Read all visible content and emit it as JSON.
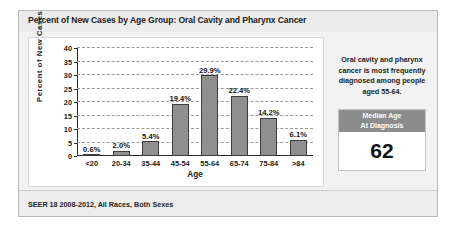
{
  "card": {
    "title": "Percent of New Cases by Age Group: Oral Cavity and Pharynx Cancer",
    "footer": "SEER 18 2008-2012, All Races, Both Sexes"
  },
  "side_panel": {
    "note": "Oral cavity and pharynx cancer is most frequently diagnosed among people aged 55-64.",
    "median_label_line1": "Median Age",
    "median_label_line2": "At Diagnosis",
    "median_value": "62"
  },
  "colors": {
    "bar_fill": "#8f8f8f",
    "bar_border": "#3d3d3d",
    "median_header": "#8c8c8c",
    "panel_background": "#f2f2f2",
    "gridline": "#9a9a9a"
  },
  "chart_data": {
    "type": "bar",
    "title": "Percent of New Cases by Age Group: Oral Cavity and Pharynx Cancer",
    "xlabel": "Age",
    "ylabel": "Percent of New Cases",
    "categories": [
      "<20",
      "20-34",
      "35-44",
      "45-54",
      "55-64",
      "65-74",
      "75-84",
      ">84"
    ],
    "values": [
      0.6,
      2.0,
      5.4,
      19.4,
      29.9,
      22.4,
      14.2,
      6.1
    ],
    "value_labels": [
      "0.6%",
      "2.0%",
      "5.4%",
      "19.4%",
      "29.9%",
      "22.4%",
      "14.2%",
      "6.1%"
    ],
    "ylim": [
      0,
      40
    ],
    "yticks": [
      0,
      5,
      10,
      15,
      20,
      25,
      30,
      35,
      40
    ],
    "ytick_labels": [
      "0",
      "5",
      "10",
      "15",
      "20",
      "25",
      "30",
      "35",
      "40"
    ],
    "grid": true,
    "legend": null
  }
}
